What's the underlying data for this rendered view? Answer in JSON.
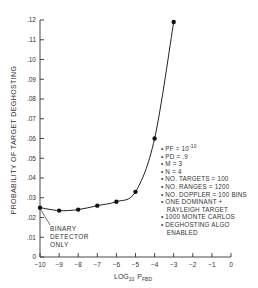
{
  "chart_data": {
    "type": "line",
    "title": "",
    "xlabel": "LOG10 PFBD",
    "ylabel": "PROBABILITY OF TARGET DEGHOSTING",
    "xlim": [
      -10,
      0
    ],
    "ylim": [
      0,
      0.12
    ],
    "x_ticks": [
      "-10",
      "-9",
      "-8",
      "-7",
      "-6",
      "-5",
      "-4",
      "-3",
      "-2",
      "-1",
      "0"
    ],
    "y_ticks": [
      "0",
      ".01",
      ".02",
      ".03",
      ".04",
      ".05",
      ".06",
      ".07",
      ".08",
      ".09",
      ".10",
      ".11",
      ".12"
    ],
    "grid": false,
    "series": [
      {
        "name": "deghosting probability",
        "x": [
          -10,
          -9,
          -8,
          -7,
          -6,
          -5,
          -4,
          -3
        ],
        "y": [
          0.025,
          0.0235,
          0.024,
          0.026,
          0.028,
          0.033,
          0.06,
          0.119
        ]
      }
    ],
    "annotations": [
      {
        "text": "BINARY DETECTOR ONLY",
        "x": -10,
        "y": 0.025
      }
    ],
    "legend_notes": [
      "• PF = 10^-10",
      "• PD = .9",
      "• M = 3",
      "• N = 4",
      "• NO. TARGETS = 100",
      "• NO. RANGES = 1200",
      "• NO. DOPPLER = 100 BINS",
      "• ONE DOMINANT +",
      "   RAYLEIGH TARGET",
      "• 1000 MONTE CARLOS",
      "• DEGHOSTING ALGO",
      "   ENABLED"
    ]
  },
  "labels": {
    "ylabel": "PROBABILITY OF TARGET DEGHOSTING",
    "xlabel_main": "LOG",
    "xlabel_sub": "10",
    "xlabel_p": "P",
    "xlabel_psub": "FBD",
    "annotation_1": "BINARY",
    "annotation_2": "DETECTOR",
    "annotation_3": "ONLY"
  },
  "notes": {
    "pf": "• PF = 10",
    "pf_exp": "-10",
    "pd": "• PD = .9",
    "m": "• M = 3",
    "n": "• N = 4",
    "targets": "• NO. TARGETS = 100",
    "ranges": "• NO. RANGES = 1200",
    "doppler": "• NO. DOPPLER = 100 BINS",
    "dominant": "• ONE DOMINANT +",
    "rayleigh": "   RAYLEIGH TARGET",
    "monte": "• 1000 MONTE CARLOS",
    "algo": "• DEGHOSTING ALGO",
    "enabled": "   ENABLED"
  }
}
